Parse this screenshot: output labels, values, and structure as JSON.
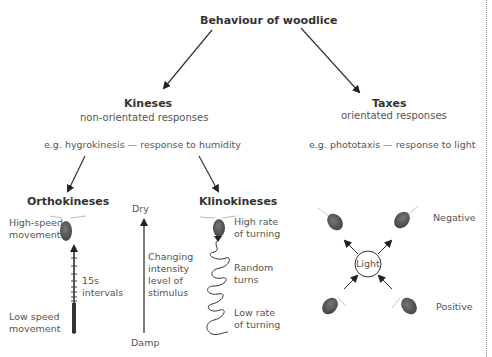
{
  "diagram": {
    "title": "Behaviour of woodlice",
    "kineses": {
      "heading": "Kineses",
      "subtitle": "non-orientated responses",
      "example": "e.g. hygrokinesis — response to humidity",
      "orthokineses": {
        "heading": "Orthokineses",
        "top_label": "High-speed movement",
        "interval_label": "15s intervals",
        "bottom_label": "Low speed movement"
      },
      "stimulus_scale": {
        "top_label": "Dry",
        "middle_label": "Changing intensity level of stimulus",
        "bottom_label": "Damp"
      },
      "klinokineses": {
        "heading": "Klinokineses",
        "top_label": "High rate of turning",
        "middle_label": "Random turns",
        "bottom_label": "Low rate of turning"
      }
    },
    "taxes": {
      "heading": "Taxes",
      "subtitle": "orientated responses",
      "example": "e.g. phototaxis — response to light",
      "center_label": "Light",
      "negative_label": "Negative",
      "positive_label": "Positive"
    },
    "colors": {
      "woodlouse": "#555555",
      "arrow": "#222222",
      "text": "#333333"
    }
  }
}
